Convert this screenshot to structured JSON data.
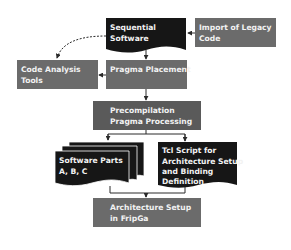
{
  "colors": {
    "document_dark": "#161616",
    "process_gray": "#6b6b6b",
    "process_dark_gray": "#5a5a5a",
    "connector": "#2a2a2a",
    "text": "#f0f0f0"
  },
  "nodes": {
    "sequential_software": {
      "line1": "Sequential",
      "line2": "Software"
    },
    "import_legacy": {
      "line1": "Import of Legacy",
      "line2": "Code"
    },
    "code_analysis": {
      "line1": "Code Analysis",
      "line2": "Tools"
    },
    "pragma_placement": {
      "line1": "Pragma Placement"
    },
    "precompilation": {
      "line1": "Precompilation",
      "line2": "Pragma Processing"
    },
    "software_parts": {
      "line1": "Software Parts",
      "line2": "A, B, C"
    },
    "tcl_script": {
      "line1": "Tcl Script for",
      "line2": "Architecture Setup",
      "line3": "and Binding",
      "line4": "Definition"
    },
    "architecture_setup": {
      "line1": "Architecture Setup",
      "line2": "in FripGa"
    }
  }
}
